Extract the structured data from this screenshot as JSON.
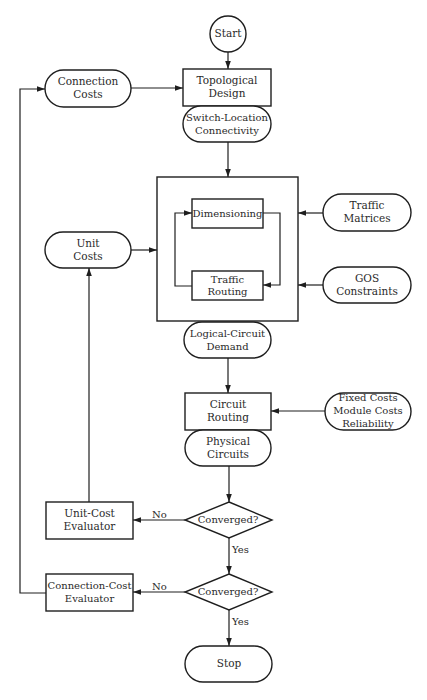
{
  "diagram": {
    "start": "Start",
    "connection_costs": [
      "Connection",
      "Costs"
    ],
    "topological_design": [
      "Topological",
      "Design"
    ],
    "switch_location": [
      "Switch-Location",
      "Connectivity"
    ],
    "dimensioning": "Dimensioning",
    "traffic_routing": [
      "Traffic",
      "Routing"
    ],
    "traffic_matrices": [
      "Traffic",
      "Matrices"
    ],
    "gos_constraints": [
      "GOS",
      "Constraints"
    ],
    "unit_costs": [
      "Unit",
      "Costs"
    ],
    "logical_circuit_demand": [
      "Logical-Circuit",
      "Demand"
    ],
    "circuit_routing": [
      "Circuit",
      "Routing"
    ],
    "fixed_costs": [
      "Fixed Costs",
      "Module Costs",
      "Reliability"
    ],
    "physical_circuits": [
      "Physical",
      "Circuits"
    ],
    "unit_cost_evaluator": [
      "Unit-Cost",
      "Evaluator"
    ],
    "connection_cost_evaluator": [
      "Connection-Cost",
      "Evaluator"
    ],
    "converged_1": "Converged?",
    "converged_2": "Converged?",
    "no_1": "No",
    "yes_1": "Yes",
    "no_2": "No",
    "yes_2": "Yes",
    "stop": "Stop"
  },
  "colors": {
    "stroke": "#1e1e1e",
    "text": "#2a2a2a",
    "background": "#ffffff"
  }
}
